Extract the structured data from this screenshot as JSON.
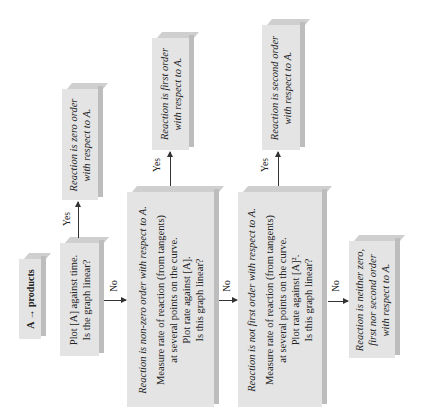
{
  "diagram": {
    "orientation": "rotated-90-ccw",
    "nodes": {
      "start": {
        "label": "A → products"
      },
      "plot_a_time": {
        "lines": [
          "Plot [A] against time.",
          "Is the graph linear?"
        ]
      },
      "zero_order": {
        "lines": [
          "Reaction is zero order",
          "with respect to A."
        ]
      },
      "non_zero": {
        "heading": "Reaction is non-zero order with respect to A.",
        "lines": [
          "Measure rate of reaction (from tangents)",
          "at several points on the curve.",
          "Plot rate against [A].",
          "Is this graph linear?"
        ]
      },
      "first_order": {
        "lines": [
          "Reaction is first order",
          "with respect to A."
        ]
      },
      "not_first": {
        "heading": "Reaction is not first order with respect to A.",
        "lines": [
          "Measure rate of reaction (from tangents)",
          "at several points on the curve.",
          "Plot rate against [A]².",
          "Is this graph linear?"
        ]
      },
      "second_order": {
        "lines": [
          "Reaction is second order",
          "with respect to A."
        ]
      },
      "neither": {
        "lines": [
          "Reaction is neither zero,",
          "first nor second order",
          "with respect to A."
        ]
      }
    },
    "edges": {
      "yes": "Yes",
      "no": "No"
    }
  }
}
